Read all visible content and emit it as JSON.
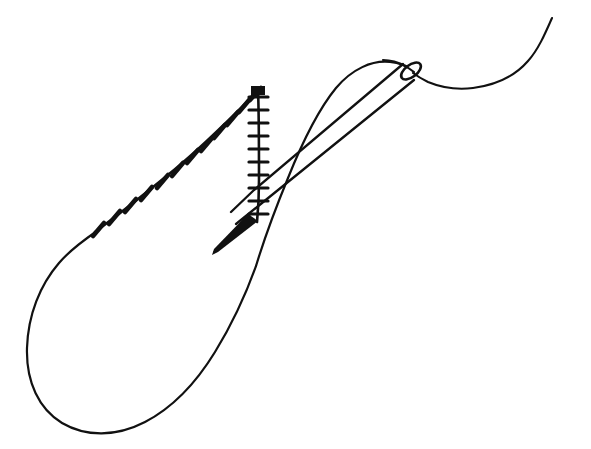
{
  "document": {
    "title": "Blanket stitch with threaded needle",
    "background_color": "#ffffff",
    "ink_color": "#111111",
    "width": 591,
    "height": 449,
    "style": "black ink line drawing, no text labels"
  },
  "figure": {
    "name": "threaded-sewing-needle-and-blanket-stitch",
    "parts": [
      {
        "id": "needle",
        "label": "sewing needle"
      },
      {
        "id": "needle-eye",
        "label": "needle eye"
      },
      {
        "id": "needle-point",
        "label": "needle point"
      },
      {
        "id": "working-thread",
        "label": "working thread tail"
      },
      {
        "id": "thread-loop",
        "label": "large thread loop"
      },
      {
        "id": "stitch-row-diagonal",
        "label": "diagonal row of worked stitches"
      },
      {
        "id": "stitch-row-vertical",
        "label": "vertical row of stitch legs"
      }
    ]
  },
  "geometry": {
    "needle": {
      "shaft_upper": "M 417 68 L 222 231",
      "shaft_lower": "M 421 79 L 226 238",
      "point_tip_x": 212,
      "point_tip_y": 254,
      "eye_center_x": 411,
      "eye_center_y": 71,
      "eye_rx": 11,
      "eye_ry": 5.5,
      "eye_rotation_deg": -35
    },
    "thread": {
      "tail_path": "M 552 18 C 541 40 532 58 518 70 C 500 85 474 90 448 86 C 432 84 420 79 412 74",
      "eye_pass_path": "M 410 67 C 398 62 384 59 372 60",
      "loop_outer_path": "M 412 70 C 404 66 396 62 388 62 C 370 62 350 72 334 94 C 318 116 300 152 282 190 C 268 220 258 245 250 268",
      "loop_lower_path": "M 250 268 C 238 300 222 338 198 372 C 170 411 132 434 100 433 C 62 432 34 404 27 362 C 20 320 36 280 66 254 C 78 244 90 236 98 230"
    },
    "stitch_row_diagonal": {
      "path": "M 98 229 C 132 204 176 168 212 134 C 232 115 248 100 257 90",
      "tick_count": 12,
      "ticks": [
        {
          "x": 99,
          "y": 228
        },
        {
          "x": 115,
          "y": 216
        },
        {
          "x": 130,
          "y": 204
        },
        {
          "x": 146,
          "y": 192
        },
        {
          "x": 161,
          "y": 180
        },
        {
          "x": 175,
          "y": 168
        },
        {
          "x": 189,
          "y": 155
        },
        {
          "x": 203,
          "y": 143
        },
        {
          "x": 216,
          "y": 130
        },
        {
          "x": 229,
          "y": 117
        },
        {
          "x": 241,
          "y": 105
        },
        {
          "x": 252,
          "y": 94
        }
      ]
    },
    "stitch_row_vertical": {
      "path": "M 258 88 L 258 220",
      "tick_count": 10,
      "ticks": [
        {
          "y": 96
        },
        {
          "y": 109
        },
        {
          "y": 122
        },
        {
          "y": 135
        },
        {
          "y": 148
        },
        {
          "y": 161
        },
        {
          "y": 174
        },
        {
          "y": 187
        },
        {
          "y": 200
        },
        {
          "y": 213
        }
      ],
      "tick_half_width": 9
    }
  }
}
